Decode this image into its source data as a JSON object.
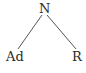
{
  "tree": {
    "root": {
      "label": "N"
    },
    "children": [
      {
        "label": "Ad"
      },
      {
        "label": "R"
      }
    ]
  },
  "colors": {
    "text": "#2a2a2a",
    "edge": "#555555",
    "background": "#ffffff"
  }
}
